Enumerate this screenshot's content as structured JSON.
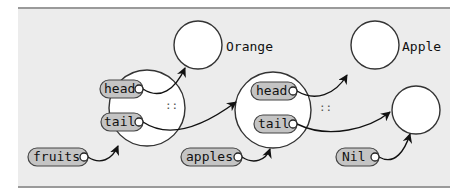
{
  "diagram": {
    "type": "linked-list-cons-cells",
    "colors": {
      "background": "#ececec",
      "frame": "#9a9a9a",
      "node_fill": "#ffffff",
      "stroke": "#333333",
      "pill_fill": "#c4c4c4",
      "arrow": "#111111"
    },
    "values": [
      {
        "id": "orange",
        "label": "Orange"
      },
      {
        "id": "apple",
        "label": "Apple"
      },
      {
        "id": "nil-node",
        "label": ""
      }
    ],
    "cells": [
      {
        "id": "cell-1",
        "head_label": "head",
        "tail_label": "tail",
        "cons_operator": "::"
      },
      {
        "id": "cell-2",
        "head_label": "head",
        "tail_label": "tail",
        "cons_operator": "::"
      }
    ],
    "variables": [
      {
        "id": "fruits",
        "label": "fruits"
      },
      {
        "id": "apples",
        "label": "apples"
      },
      {
        "id": "nil",
        "label": "Nil"
      }
    ],
    "edges": [
      {
        "from": "cell-1.head",
        "to": "orange"
      },
      {
        "from": "cell-1.tail",
        "to": "cell-2"
      },
      {
        "from": "cell-2.head",
        "to": "apple"
      },
      {
        "from": "cell-2.tail",
        "to": "nil-node"
      },
      {
        "from": "fruits",
        "to": "cell-1"
      },
      {
        "from": "apples",
        "to": "cell-2"
      },
      {
        "from": "nil",
        "to": "nil-node"
      }
    ]
  }
}
